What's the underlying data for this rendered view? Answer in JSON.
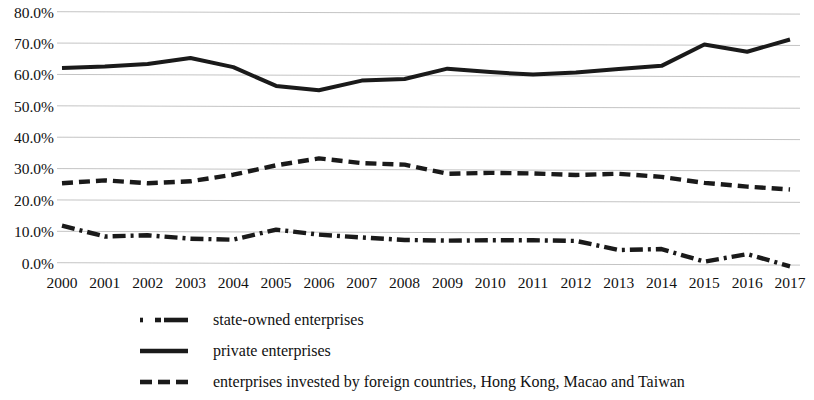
{
  "chart_data": {
    "type": "line",
    "title": "",
    "subtitle": "",
    "xlabel": "",
    "ylabel": "",
    "categories": [
      "2000",
      "2001",
      "2002",
      "2003",
      "2004",
      "2005",
      "2006",
      "2007",
      "2008",
      "2009",
      "2010",
      "2011",
      "2012",
      "2013",
      "2014",
      "2015",
      "2016",
      "2017"
    ],
    "x": [
      2000,
      2001,
      2002,
      2003,
      2004,
      2005,
      2006,
      2007,
      2008,
      2009,
      2010,
      2011,
      2012,
      2013,
      2014,
      2015,
      2016,
      2017
    ],
    "ylim": [
      0.0,
      80.0
    ],
    "ytick_labels": [
      "80.0%",
      "70.0%",
      "60.0%",
      "50.0%",
      "40.0%",
      "30.0%",
      "20.0%",
      "10.0%",
      "0.0%"
    ],
    "ytick_values": [
      80.0,
      70.0,
      60.0,
      50.0,
      40.0,
      30.0,
      20.0,
      10.0,
      0.0
    ],
    "ytick_step": 10.0,
    "y_unit": "%",
    "grid": true,
    "grid_axis": "y",
    "legend_position": "bottom-left",
    "series": [
      {
        "name": "state-owned enterprises",
        "line_style": "dash-dot",
        "color": "#1a1a1a",
        "values": [
          12.1,
          8.6,
          9.0,
          7.9,
          7.6,
          10.8,
          9.2,
          8.3,
          7.5,
          7.3,
          7.4,
          7.4,
          7.2,
          4.3,
          4.6,
          0.6,
          3.0,
          -0.9
        ]
      },
      {
        "name": "private enterprises",
        "line_style": "solid",
        "color": "#1a1a1a",
        "values": [
          62.3,
          62.8,
          63.6,
          65.5,
          62.6,
          56.6,
          55.2,
          58.3,
          58.8,
          62.1,
          61.0,
          60.2,
          60.9,
          62.0,
          63.0,
          69.8,
          67.5,
          71.4
        ]
      },
      {
        "name": "enterprises invested by foreign countries, Hong Kong, Macao and Taiwan",
        "line_style": "dashed",
        "color": "#1a1a1a",
        "values": [
          25.6,
          26.5,
          25.6,
          26.2,
          28.3,
          31.3,
          33.5,
          32.0,
          31.5,
          28.6,
          28.9,
          28.7,
          28.2,
          28.6,
          27.6,
          25.7,
          24.5,
          23.6
        ]
      }
    ]
  },
  "axis": {
    "y_ticks": [
      "80.0%",
      "70.0%",
      "60.0%",
      "50.0%",
      "40.0%",
      "30.0%",
      "20.0%",
      "10.0%",
      "0.0%"
    ],
    "x_ticks": [
      "2000",
      "2001",
      "2002",
      "2003",
      "2004",
      "2005",
      "2006",
      "2007",
      "2008",
      "2009",
      "2010",
      "2011",
      "2012",
      "2013",
      "2014",
      "2015",
      "2016",
      "2017"
    ]
  },
  "legend": {
    "items": [
      {
        "label": "state-owned enterprises",
        "marker": "dash-dot-line-icon"
      },
      {
        "label": "private enterprises",
        "marker": "solid-line-icon"
      },
      {
        "label": "enterprises invested by foreign countries, Hong Kong, Macao and Taiwan",
        "marker": "dashed-line-icon"
      }
    ]
  },
  "style": {
    "line_color": "#1a1a1a",
    "grid_color": "#bdbdbd",
    "background": "#ffffff",
    "text_color": "#111111"
  }
}
